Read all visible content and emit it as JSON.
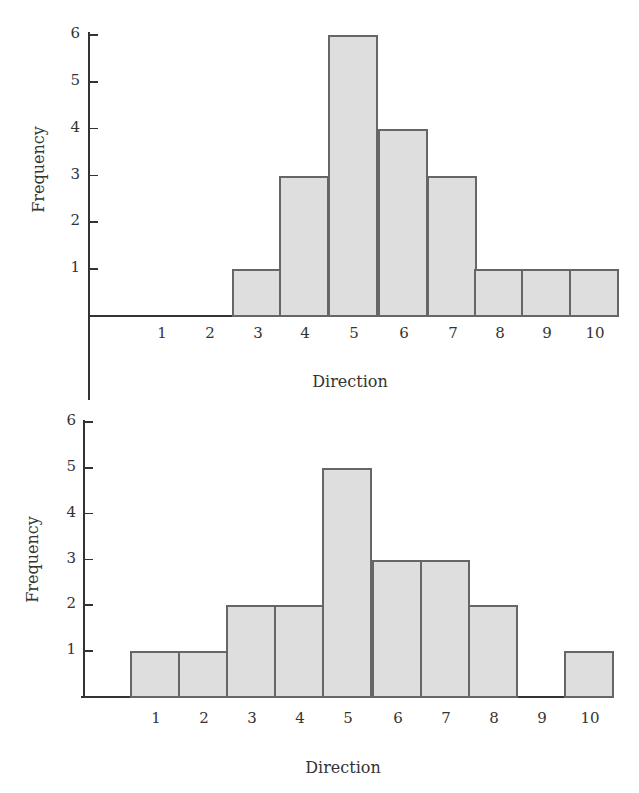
{
  "chart_data": [
    {
      "type": "bar",
      "subtype": "histogram",
      "title": "",
      "xlabel": "Direction",
      "ylabel": "Frequency",
      "categories": [
        "1",
        "2",
        "3",
        "4",
        "5",
        "6",
        "7",
        "8",
        "9",
        "10"
      ],
      "values": [
        0,
        0,
        1,
        3,
        6,
        4,
        3,
        1,
        1,
        1
      ],
      "yticks": [
        "1",
        "2",
        "3",
        "4",
        "5",
        "6"
      ],
      "ylim": [
        0,
        6
      ],
      "grid": false,
      "legend": null
    },
    {
      "type": "bar",
      "subtype": "histogram",
      "title": "",
      "xlabel": "Direction",
      "ylabel": "Frequency",
      "categories": [
        "1",
        "2",
        "3",
        "4",
        "5",
        "6",
        "7",
        "8",
        "9",
        "10"
      ],
      "values": [
        1,
        1,
        2,
        2,
        5,
        3,
        3,
        2,
        0,
        1
      ],
      "yticks": [
        "1",
        "2",
        "3",
        "4",
        "5",
        "6"
      ],
      "ylim": [
        0,
        6
      ],
      "grid": false,
      "legend": null
    }
  ],
  "colors": {
    "bar_fill": "#dedede",
    "bar_stroke": "#666666",
    "axis": "#333333"
  }
}
